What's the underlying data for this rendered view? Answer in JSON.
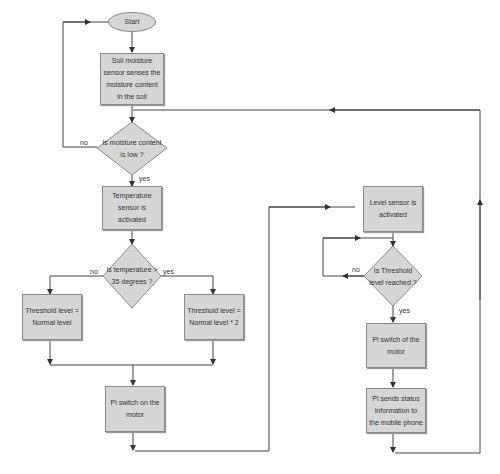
{
  "flowchart": {
    "start": "Start",
    "soil_sensor": "Soil moisture sensor senses the moisture content in the soil",
    "moisture_decision": "Is moisture content is low ?",
    "temp_sensor": "Temperature sensor is activated",
    "temp_decision": "Is temperature > 35 degrees ?",
    "threshold_normal": "Threshold level = Normal level",
    "threshold_double": "Threshold level = Normal level * 2",
    "motor_on": "Pi switch on the motor",
    "level_sensor": "Level sensor is activated",
    "threshold_decision": "Is Threshold level reached ?",
    "motor_off": "Pi switch of the motor",
    "send_status": "Pi sends status information to the mobile phone"
  },
  "labels": {
    "moisture_no": "no",
    "moisture_yes": "yes",
    "temp_no": "no",
    "temp_yes": "yes",
    "threshold_no": "no",
    "threshold_yes": "yes"
  },
  "colors": {
    "node_fill": "#d6d6d6",
    "node_border": "#8a8a8a",
    "line": "#333333"
  }
}
